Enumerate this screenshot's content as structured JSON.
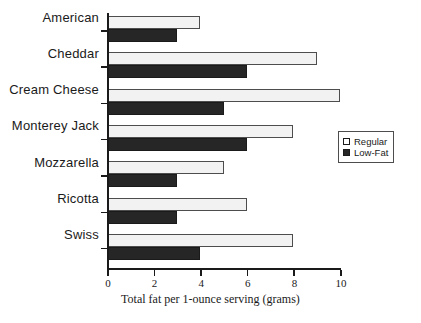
{
  "chart_data": {
    "type": "bar",
    "orientation": "horizontal",
    "title": "",
    "xlabel": "Total fat per 1-ounce serving (grams)",
    "ylabel": "",
    "xlim": [
      0,
      10
    ],
    "xticks": [
      0,
      2,
      4,
      6,
      8,
      10
    ],
    "grid": false,
    "legend_position": "right",
    "categories": [
      "American",
      "Cheddar",
      "Cream Cheese",
      "Monterey Jack",
      "Mozzarella",
      "Ricotta",
      "Swiss"
    ],
    "series": [
      {
        "name": "Regular",
        "color": "#f2f2f2",
        "values": [
          4,
          9,
          10,
          8,
          5,
          6,
          8
        ]
      },
      {
        "name": "Low-Fat",
        "color": "#262626",
        "values": [
          3,
          6,
          5,
          6,
          3,
          3,
          4
        ]
      }
    ]
  },
  "legend": {
    "items": [
      {
        "label": "Regular",
        "swatch": "open-square-icon"
      },
      {
        "label": "Low-Fat",
        "swatch": "filled-square-icon"
      }
    ]
  },
  "axis": {
    "x_title": "Total fat per 1-ounce serving (grams)",
    "tick_labels": [
      "0",
      "2",
      "4",
      "6",
      "8",
      "10"
    ]
  }
}
